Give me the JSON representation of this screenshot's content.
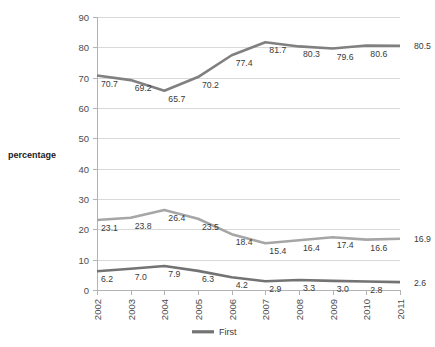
{
  "chart_data": {
    "type": "line",
    "title": "",
    "xlabel": "",
    "ylabel": "percentage",
    "ylim": [
      0,
      90
    ],
    "ytick_step": 10,
    "yticks": [
      "0",
      "10",
      "20",
      "30",
      "40",
      "50",
      "60",
      "70",
      "80",
      "90"
    ],
    "grid": true,
    "legend_position": "bottom",
    "categories": [
      "2002",
      "2003",
      "2004",
      "2005",
      "2006",
      "2007",
      "2008",
      "2009",
      "2010",
      "2011"
    ],
    "series": [
      {
        "name": "Top series",
        "color": "#808080",
        "values": [
          70.7,
          69.2,
          65.7,
          70.2,
          77.4,
          81.7,
          80.3,
          79.6,
          80.6,
          80.5
        ],
        "labels": [
          "70.7",
          "69.2",
          "65.7",
          "70.2",
          "77.4",
          "81.7",
          "80.3",
          "79.6",
          "80.6",
          "80.5"
        ]
      },
      {
        "name": "Middle series",
        "color": "#a6a6a6",
        "values": [
          23.1,
          23.8,
          26.4,
          23.5,
          18.4,
          15.4,
          16.4,
          17.4,
          16.6,
          16.9
        ],
        "labels": [
          "23.1",
          "23.8",
          "26.4",
          "23.5",
          "18.4",
          "15.4",
          "16.4",
          "17.4",
          "16.6",
          "16.9"
        ]
      },
      {
        "name": "First",
        "color": "#737373",
        "values": [
          6.2,
          7.0,
          7.9,
          6.3,
          4.2,
          2.9,
          3.3,
          3.0,
          2.8,
          2.6
        ],
        "labels": [
          "6.2",
          "7.0",
          "7.9",
          "6.3",
          "4.2",
          "2.9",
          "3.3",
          "3.0",
          "2.8",
          "2.6"
        ]
      }
    ],
    "legend": [
      {
        "label": "First",
        "color": "#737373"
      }
    ]
  },
  "axis": {
    "y_title": "percentage"
  }
}
